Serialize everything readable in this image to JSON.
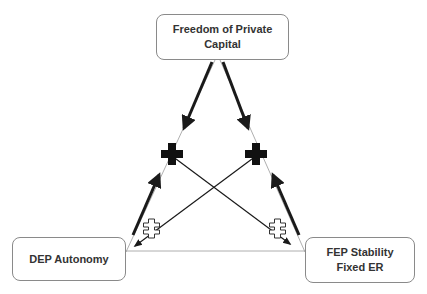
{
  "diagram": {
    "type": "impossible-trinity",
    "nodes": {
      "top": {
        "lines": [
          "Freedom of Private",
          "Capital"
        ]
      },
      "left": {
        "lines": [
          "DEP Autonomy"
        ]
      },
      "right": {
        "lines": [
          "FEP Stability",
          "Fixed ER"
        ]
      }
    },
    "markers": {
      "compatible_symbol": "plus",
      "incompatible_symbol": "not-equal-cross"
    },
    "colors": {
      "arrow": "#1a1a1a",
      "box_border": "#8a8a8a",
      "triangle_edge": "#9a9a9a",
      "text": "#333333"
    }
  }
}
